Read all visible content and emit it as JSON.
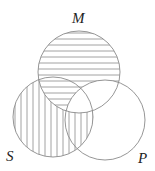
{
  "diagram": {
    "type": "venn-3",
    "sets": [
      {
        "id": "M",
        "label": "M",
        "cx": 79,
        "cy": 72,
        "r": 41,
        "label_x": 72,
        "label_y": 23
      },
      {
        "id": "S",
        "label": "S",
        "cx": 53,
        "cy": 117,
        "r": 40,
        "label_x": 6,
        "label_y": 161
      },
      {
        "id": "P",
        "label": "P",
        "cx": 105,
        "cy": 120,
        "r": 40,
        "label_x": 138,
        "label_y": 163
      }
    ],
    "shading": {
      "M_only": "horizontal",
      "S_and_M_not_P": "horizontal",
      "S_only": "vertical",
      "S_and_P_not_M": "vertical",
      "M_and_P_not_S": "none",
      "S_and_M_and_P": "none",
      "P_only": "none"
    },
    "colors": {
      "stroke": "#8a8a8a",
      "label": "#222222",
      "background": "#ffffff"
    }
  }
}
